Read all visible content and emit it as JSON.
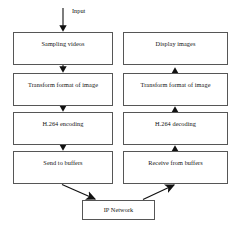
{
  "diagram": {
    "canvas": {
      "width": 238,
      "height": 229,
      "background": "#ffffff"
    },
    "style": {
      "box_border": "#565656",
      "box_fill": "#ffffff",
      "arrow": "#111111",
      "text": "#131313"
    },
    "entry": {
      "label": "Input",
      "arrow": "down-arrow-into-sampling-videos"
    },
    "columns": {
      "sender": {
        "name": "encoding pipeline",
        "direction": "top-to-bottom",
        "nodes": [
          {
            "id": "sampling-videos",
            "label": "Sampling videos"
          },
          {
            "id": "transform-format-encode",
            "label": "Transform format of image"
          },
          {
            "id": "h264-encoding",
            "label": "H.264 encoding"
          },
          {
            "id": "send-to-buffers",
            "label": "Send to buffers"
          }
        ]
      },
      "receiver": {
        "name": "decoding pipeline",
        "direction": "bottom-to-top",
        "nodes": [
          {
            "id": "display-images",
            "label": "Display images"
          },
          {
            "id": "transform-format-decode",
            "label": "Transform format of image"
          },
          {
            "id": "h264-decoding",
            "label": "H.264 decoding"
          },
          {
            "id": "receive-from-buffers",
            "label": "Receive from buffers"
          }
        ]
      }
    },
    "network": {
      "id": "ip-network",
      "label": "IP Network"
    },
    "edges": [
      {
        "from": "input",
        "to": "sampling-videos",
        "kind": "vertical-down"
      },
      {
        "from": "sampling-videos",
        "to": "transform-format-encode",
        "kind": "vertical-down"
      },
      {
        "from": "transform-format-encode",
        "to": "h264-encoding",
        "kind": "vertical-down"
      },
      {
        "from": "h264-encoding",
        "to": "send-to-buffers",
        "kind": "vertical-down"
      },
      {
        "from": "send-to-buffers",
        "to": "ip-network",
        "kind": "diagonal-down-right"
      },
      {
        "from": "ip-network",
        "to": "receive-from-buffers",
        "kind": "diagonal-up-right"
      },
      {
        "from": "receive-from-buffers",
        "to": "h264-decoding",
        "kind": "vertical-up"
      },
      {
        "from": "h264-decoding",
        "to": "transform-format-decode",
        "kind": "vertical-up"
      },
      {
        "from": "transform-format-decode",
        "to": "display-images",
        "kind": "vertical-up"
      }
    ]
  }
}
